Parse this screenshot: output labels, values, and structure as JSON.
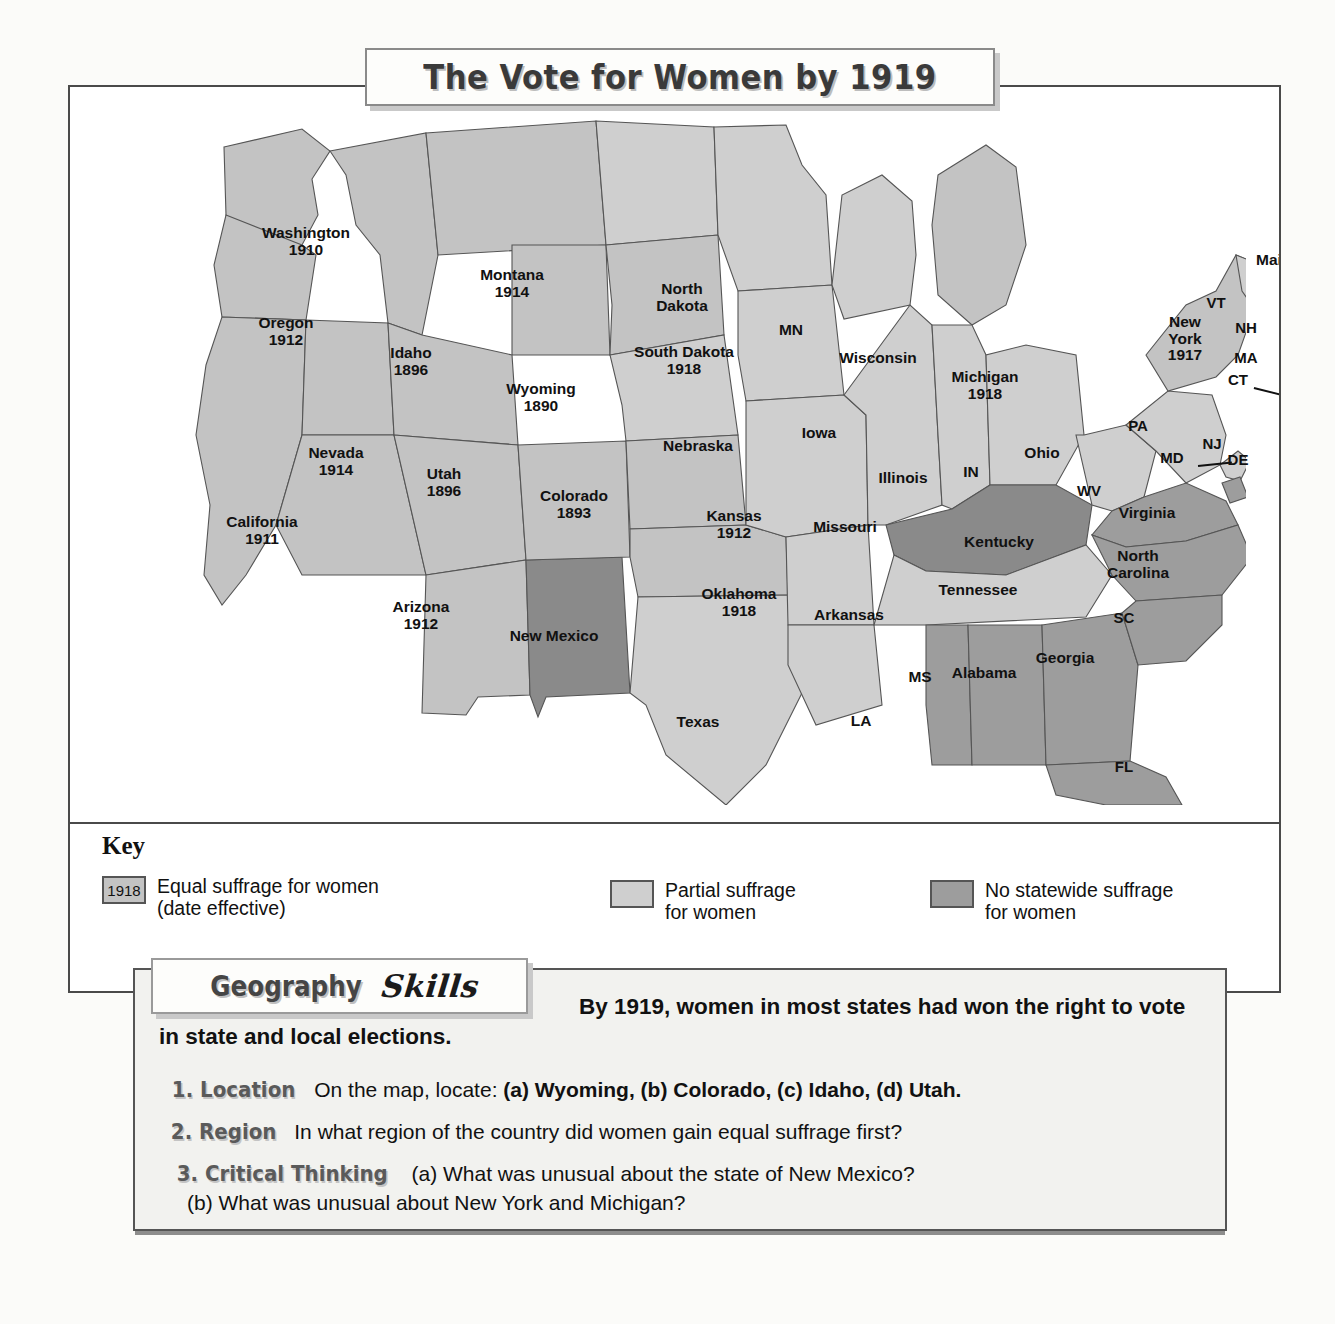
{
  "title": "The Vote for Women by 1919",
  "map": {
    "states": [
      {
        "code": "WA",
        "name": "Washington",
        "year": "1910",
        "status": "equal",
        "x": 236,
        "y": 155
      },
      {
        "code": "OR",
        "name": "Oregon",
        "year": "1912",
        "status": "equal",
        "x": 216,
        "y": 245
      },
      {
        "code": "ID",
        "name": "Idaho",
        "year": "1896",
        "status": "equal",
        "x": 341,
        "y": 275
      },
      {
        "code": "MT",
        "name": "Montana",
        "year": "1914",
        "status": "equal",
        "x": 442,
        "y": 197
      },
      {
        "code": "WY",
        "name": "Wyoming",
        "year": "1890",
        "status": "equal",
        "x": 471,
        "y": 311
      },
      {
        "code": "NV",
        "name": "Nevada",
        "year": "1914",
        "status": "equal",
        "x": 266,
        "y": 375
      },
      {
        "code": "UT",
        "name": "Utah",
        "year": "1896",
        "status": "equal",
        "x": 374,
        "y": 396
      },
      {
        "code": "CA",
        "name": "California",
        "year": "1911",
        "status": "equal",
        "x": 192,
        "y": 444
      },
      {
        "code": "AZ",
        "name": "Arizona",
        "year": "1912",
        "status": "equal",
        "x": 351,
        "y": 529
      },
      {
        "code": "NM",
        "name": "New Mexico",
        "year": "",
        "status": "none",
        "x": 484,
        "y": 549
      },
      {
        "code": "CO",
        "name": "Colorado",
        "year": "1893",
        "status": "equal",
        "x": 504,
        "y": 418
      },
      {
        "code": "ND",
        "name": "North Dakota",
        "year": "",
        "status": "partial",
        "x": 612,
        "y": 211
      },
      {
        "code": "SD",
        "name": "South Dakota",
        "year": "1918",
        "status": "equal",
        "x": 614,
        "y": 274
      },
      {
        "code": "NE",
        "name": "Nebraska",
        "year": "",
        "status": "partial",
        "x": 628,
        "y": 359
      },
      {
        "code": "KS",
        "name": "Kansas",
        "year": "1912",
        "status": "equal",
        "x": 664,
        "y": 438
      },
      {
        "code": "OK",
        "name": "Oklahoma",
        "year": "1918",
        "status": "equal",
        "x": 669,
        "y": 516
      },
      {
        "code": "TX",
        "name": "Texas",
        "year": "",
        "status": "partial",
        "x": 628,
        "y": 635
      },
      {
        "code": "MN",
        "name": "MN",
        "year": "",
        "status": "partial",
        "x": 721,
        "y": 243
      },
      {
        "code": "IA",
        "name": "Iowa",
        "year": "",
        "status": "partial",
        "x": 749,
        "y": 346
      },
      {
        "code": "MO",
        "name": "Missouri",
        "year": "",
        "status": "partial",
        "x": 775,
        "y": 440
      },
      {
        "code": "AR",
        "name": "Arkansas",
        "year": "",
        "status": "partial",
        "x": 779,
        "y": 528
      },
      {
        "code": "LA",
        "name": "LA",
        "year": "",
        "status": "partial",
        "x": 791,
        "y": 634
      },
      {
        "code": "WI",
        "name": "Wisconsin",
        "year": "",
        "status": "partial",
        "x": 808,
        "y": 271
      },
      {
        "code": "IL",
        "name": "Illinois",
        "year": "",
        "status": "partial",
        "x": 833,
        "y": 391
      },
      {
        "code": "MS",
        "name": "MS",
        "year": "",
        "status": "none",
        "x": 850,
        "y": 590
      },
      {
        "code": "MI",
        "name": "Michigan",
        "year": "1918",
        "status": "equal",
        "x": 915,
        "y": 299
      },
      {
        "code": "IN",
        "name": "IN",
        "year": "",
        "status": "partial",
        "x": 901,
        "y": 385
      },
      {
        "code": "TN",
        "name": "Tennessee",
        "year": "",
        "status": "partial",
        "x": 908,
        "y": 503
      },
      {
        "code": "AL",
        "name": "Alabama",
        "year": "",
        "status": "none",
        "x": 914,
        "y": 586
      },
      {
        "code": "KY",
        "name": "Kentucky",
        "year": "",
        "status": "none",
        "x": 929,
        "y": 455
      },
      {
        "code": "OH",
        "name": "Ohio",
        "year": "",
        "status": "partial",
        "x": 972,
        "y": 366
      },
      {
        "code": "GA",
        "name": "Georgia",
        "year": "",
        "status": "none",
        "x": 995,
        "y": 571
      },
      {
        "code": "WV",
        "name": "WV",
        "year": "",
        "status": "partial",
        "x": 1019,
        "y": 404
      },
      {
        "code": "FL",
        "name": "FL",
        "year": "",
        "status": "none",
        "x": 1054,
        "y": 680
      },
      {
        "code": "SC",
        "name": "SC",
        "year": "",
        "status": "none",
        "x": 1054,
        "y": 531
      },
      {
        "code": "NC",
        "name": "North Carolina",
        "year": "",
        "status": "none",
        "x": 1068,
        "y": 478
      },
      {
        "code": "PA",
        "name": "PA",
        "year": "",
        "status": "partial",
        "x": 1068,
        "y": 339
      },
      {
        "code": "VA",
        "name": "Virginia",
        "year": "",
        "status": "none",
        "x": 1077,
        "y": 426
      },
      {
        "code": "MD",
        "name": "MD",
        "year": "",
        "status": "none",
        "x": 1102,
        "y": 371
      },
      {
        "code": "DE",
        "name": "DE",
        "year": "",
        "status": "none",
        "x": 1168,
        "y": 373
      },
      {
        "code": "NJ",
        "name": "NJ",
        "year": "",
        "status": "partial",
        "x": 1142,
        "y": 357
      },
      {
        "code": "NY",
        "name": "New York",
        "year": "1917",
        "status": "equal",
        "x": 1115,
        "y": 252
      },
      {
        "code": "VT",
        "name": "VT",
        "year": "",
        "status": "partial",
        "x": 1146,
        "y": 216
      },
      {
        "code": "NH",
        "name": "NH",
        "year": "",
        "status": "partial",
        "x": 1176,
        "y": 241
      },
      {
        "code": "MA",
        "name": "MA",
        "year": "",
        "status": "partial",
        "x": 1176,
        "y": 271
      },
      {
        "code": "CT",
        "name": "CT",
        "year": "",
        "status": "partial",
        "x": 1168,
        "y": 293
      },
      {
        "code": "RI",
        "name": "RI",
        "year": "",
        "status": "partial",
        "x": 1216,
        "y": 306
      },
      {
        "code": "ME",
        "name": "Maine",
        "year": "",
        "status": "partial",
        "x": 1208,
        "y": 173
      }
    ]
  },
  "key": {
    "title": "Key",
    "items": [
      {
        "swatch_label": "1918",
        "line1": "Equal suffrage for women",
        "line2": "(date effective)",
        "type": "equal"
      },
      {
        "swatch_label": "",
        "line1": "Partial suffrage",
        "line2": "for women",
        "type": "partial"
      },
      {
        "swatch_label": "",
        "line1": "No statewide suffrage",
        "line2": "for women",
        "type": "none"
      }
    ]
  },
  "geography": {
    "badge_word1": "Geography",
    "badge_word2": "Skills",
    "intro": "By 1919, women in most states had won the right to vote in state and local elections.",
    "questions": [
      {
        "num": "1.",
        "label": "Location",
        "text_a": "On the map, locate:",
        "parts": "(a) Wyoming, (b) Colorado, (c) Idaho, (d) Utah."
      },
      {
        "num": "2.",
        "label": "Region",
        "text_a": "In what region of the country did women gain equal suffrage first?",
        "parts": ""
      },
      {
        "num": "3.",
        "label": "Critical Thinking",
        "text_a": "(a) What was unusual about the state of New Mexico?",
        "parts": "(b) What was unusual about New York and Michigan?"
      }
    ]
  },
  "colors": {
    "equal": "#c3c3c3",
    "partial": "#cfcfcf",
    "none": "#9d9d9d",
    "frame": "#4a4a4a"
  }
}
